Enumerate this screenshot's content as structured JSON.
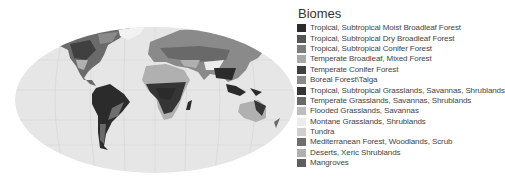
{
  "legend": {
    "title": "Biomes",
    "items": [
      {
        "label": "Tropical, Subtropical Moist Broadleaf Forest",
        "color": "#2b2b2b"
      },
      {
        "label": "Tropical, Subtropical Dry Broadleaf Forest",
        "color": "#555555"
      },
      {
        "label": "Tropical, Subtropical Conifer Forest",
        "color": "#7d7d7d"
      },
      {
        "label": "Temperate Broadleaf, Mixed Forest",
        "color": "#a9a9a9"
      },
      {
        "label": "Temperate Conifer Forest",
        "color": "#404040"
      },
      {
        "label": "Boreal Forest\\Taiga",
        "color": "#8a8a8a"
      },
      {
        "label": "Tropical, Subtropical Grasslands, Savannas, Shrublands",
        "color": "#353535"
      },
      {
        "label": "Temperate Grasslands, Savannas, Shrublands",
        "color": "#696969"
      },
      {
        "label": "Flooded Grasslands, Savannas",
        "color": "#bdbdbd"
      },
      {
        "label": "Montane Grasslands, Shrublands",
        "color": "#ececec"
      },
      {
        "label": "Tundra",
        "color": "#cfcfcf"
      },
      {
        "label": "Mediterranean Forest, Woodlands, Scrub",
        "color": "#6e6e6e"
      },
      {
        "label": "Deserts, Xeric Shrublands",
        "color": "#b0b0b0"
      },
      {
        "label": "Mangroves",
        "color": "#5e5e5e"
      }
    ]
  },
  "map": {
    "ocean_color": "#e6e6e6",
    "graticule_color": "#c8c8c8"
  }
}
